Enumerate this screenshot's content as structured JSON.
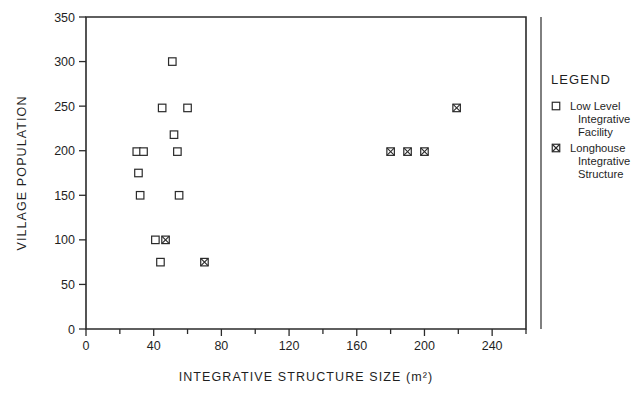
{
  "chart_data": {
    "type": "scatter",
    "title": "",
    "xlabel": "INTEGRATIVE STRUCTURE SIZE (m²)",
    "ylabel": "VILLAGE POPULATION",
    "xlim": [
      0,
      260
    ],
    "ylim": [
      0,
      350
    ],
    "xticks": [
      0,
      40,
      80,
      120,
      160,
      200,
      240
    ],
    "xticklabels": [
      "0",
      "40",
      "80",
      "120",
      "160",
      "200",
      "240"
    ],
    "xminor_step": 20,
    "yticks": [
      0,
      50,
      100,
      150,
      200,
      250,
      300,
      350
    ],
    "yticklabels": [
      "0",
      "50",
      "100",
      "150",
      "200",
      "250",
      "300",
      "350"
    ],
    "grid": false,
    "legend_position": "right",
    "series": [
      {
        "name": "Low Level Integrative Facility",
        "marker": "open-square",
        "points": [
          {
            "x": 32,
            "y": 150
          },
          {
            "x": 55,
            "y": 150
          },
          {
            "x": 31,
            "y": 175
          },
          {
            "x": 30,
            "y": 199
          },
          {
            "x": 34,
            "y": 199
          },
          {
            "x": 54,
            "y": 199
          },
          {
            "x": 52,
            "y": 218
          },
          {
            "x": 45,
            "y": 248
          },
          {
            "x": 60,
            "y": 248
          },
          {
            "x": 51,
            "y": 300
          },
          {
            "x": 41,
            "y": 100
          },
          {
            "x": 44,
            "y": 75
          }
        ]
      },
      {
        "name": "Longhouse Integrative Structure",
        "marker": "crossed-square",
        "points": [
          {
            "x": 47,
            "y": 100
          },
          {
            "x": 70,
            "y": 75
          },
          {
            "x": 180,
            "y": 199
          },
          {
            "x": 190,
            "y": 199
          },
          {
            "x": 200,
            "y": 199
          },
          {
            "x": 219,
            "y": 248
          }
        ]
      }
    ]
  },
  "legend": {
    "title": "LEGEND",
    "entries": [
      {
        "marker": "open-square",
        "lines": [
          "Low Level",
          "Integrative",
          "Facility"
        ]
      },
      {
        "marker": "crossed-square",
        "lines": [
          "Longhouse",
          "Integrative",
          "Structure"
        ]
      }
    ]
  },
  "colors": {
    "ink": "#2b2b2b",
    "background": "#ffffff"
  }
}
